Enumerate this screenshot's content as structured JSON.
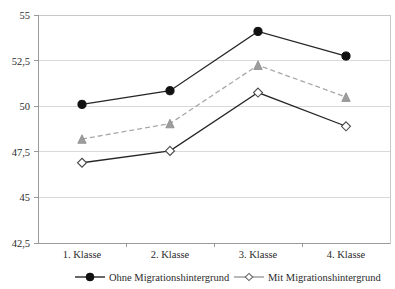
{
  "chart_data": {
    "type": "line",
    "title": "",
    "subtitle": "",
    "xlabel": "",
    "ylabel": "",
    "categories": [
      "1. Klasse",
      "2. Klasse",
      "3. Klasse",
      "4. Klasse"
    ],
    "ylim": [
      42.5,
      55
    ],
    "y_ticks": [
      42.5,
      45,
      47.5,
      50,
      52.5,
      55
    ],
    "y_tick_labels": [
      "42,5",
      "45",
      "47,5",
      "50",
      "52,5",
      "55"
    ],
    "grid": true,
    "legend_position": "bottom",
    "series": [
      {
        "name": "Ohne Migrationshintergrund",
        "values": [
          50.1,
          50.85,
          54.1,
          52.75
        ],
        "marker": "filled-circle",
        "line_style": "solid",
        "color": "#262626"
      },
      {
        "name": "Mittelwert gesamt",
        "values": [
          48.2,
          49.05,
          52.25,
          50.5
        ],
        "marker": "gray-triangle",
        "line_style": "dashed",
        "color": "#a8a8a8"
      },
      {
        "name": "Mit Migrationshintergrund",
        "values": [
          46.9,
          47.55,
          50.75,
          48.9
        ],
        "marker": "open-diamond",
        "line_style": "solid",
        "color": "#4a4a4a"
      }
    ],
    "legend_entries": [
      {
        "label": "Ohne Migrationshintergrund",
        "marker": "filled-circle",
        "line_style": "solid",
        "color": "#262626"
      },
      {
        "label": "Mit Migrationshintergrund",
        "marker": "open-diamond",
        "line_style": "solid",
        "color": "#8f8f8f"
      }
    ]
  },
  "axis": {
    "y_labels": {
      "t0": "55",
      "t1": "52,5",
      "t2": "50",
      "t3": "47,5",
      "t4": "45",
      "t5": "42,5"
    },
    "x_labels": {
      "c0": "1. Klasse",
      "c1": "2. Klasse",
      "c2": "3. Klasse",
      "c3": "4. Klasse"
    }
  },
  "legend": {
    "entry0": "Ohne Migrationshintergrund",
    "entry1": "Mit Migrationshintergrund"
  }
}
